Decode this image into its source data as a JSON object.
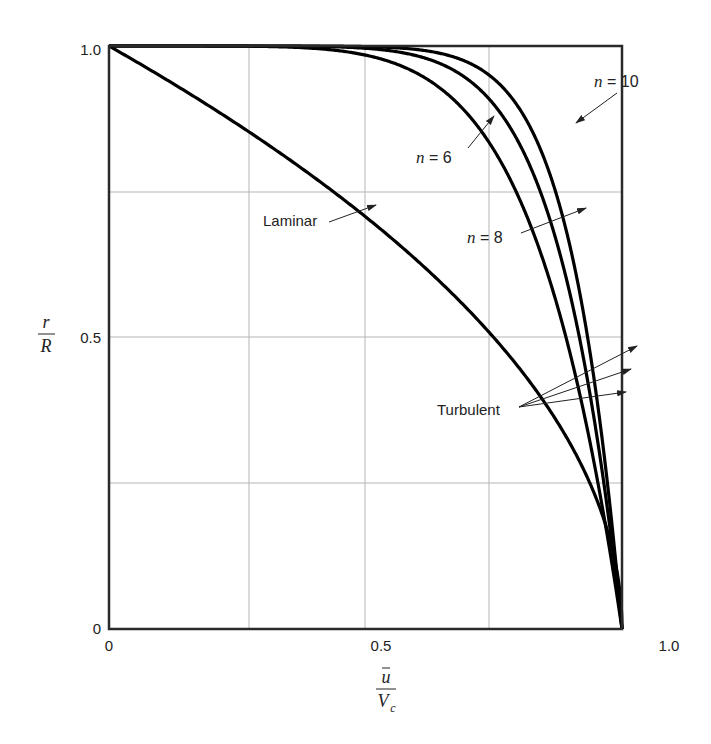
{
  "chart_data": {
    "type": "line",
    "title": "",
    "xlabel": "ū / V_c",
    "ylabel": "r / R",
    "xlim": [
      0,
      1.0
    ],
    "ylim": [
      0,
      1.0
    ],
    "grid": true,
    "x_ticks_labeled": [
      "0",
      "0.5",
      "1.0"
    ],
    "y_ticks_labeled": [
      "0",
      "0.5",
      "1.0"
    ],
    "gridlines_x": [
      0.25,
      0.5,
      0.75
    ],
    "gridlines_y": [
      0.25,
      0.5,
      0.75
    ],
    "series": [
      {
        "name": "Laminar",
        "formula": "u/Vc = 1 - (r/R)^2",
        "r": [
          0,
          0.1,
          0.2,
          0.3,
          0.4,
          0.5,
          0.6,
          0.7,
          0.8,
          0.9,
          0.95,
          1.0
        ],
        "u": [
          1.0,
          0.99,
          0.96,
          0.91,
          0.84,
          0.75,
          0.64,
          0.51,
          0.36,
          0.19,
          0.0975,
          0.0
        ]
      },
      {
        "name": "n = 6",
        "formula": "u/Vc = (1 - r/R)^(1/6)",
        "r": [
          0,
          0.1,
          0.2,
          0.3,
          0.4,
          0.5,
          0.6,
          0.7,
          0.8,
          0.9,
          0.95,
          0.99,
          1.0
        ],
        "u": [
          1.0,
          0.983,
          0.963,
          0.942,
          0.918,
          0.891,
          0.858,
          0.818,
          0.765,
          0.681,
          0.607,
          0.464,
          0.0
        ]
      },
      {
        "name": "n = 8",
        "formula": "u/Vc = (1 - r/R)^(1/8)",
        "r": [
          0,
          0.1,
          0.2,
          0.3,
          0.4,
          0.5,
          0.6,
          0.7,
          0.8,
          0.9,
          0.95,
          0.99,
          1.0
        ],
        "u": [
          1.0,
          0.987,
          0.972,
          0.956,
          0.938,
          0.917,
          0.892,
          0.86,
          0.818,
          0.75,
          0.688,
          0.562,
          0.0
        ]
      },
      {
        "name": "n = 10",
        "formula": "u/Vc = (1 - r/R)^(1/10)",
        "r": [
          0,
          0.1,
          0.2,
          0.3,
          0.4,
          0.5,
          0.6,
          0.7,
          0.8,
          0.9,
          0.95,
          0.99,
          1.0
        ],
        "u": [
          1.0,
          0.99,
          0.978,
          0.965,
          0.95,
          0.933,
          0.912,
          0.887,
          0.851,
          0.794,
          0.741,
          0.631,
          0.0
        ]
      }
    ],
    "annotations": [
      {
        "text": "Laminar",
        "points_to": "Laminar curve"
      },
      {
        "text": "n = 6",
        "points_to": "n = 6 curve"
      },
      {
        "text": "n = 8",
        "points_to": "n = 8 curve"
      },
      {
        "text": "n = 10",
        "points_to": "n = 10 curve"
      },
      {
        "text": "Turbulent",
        "points_to": "n = 6, n = 8, n = 10 curves (three arrows)"
      }
    ]
  },
  "labels": {
    "y_tick_0": "0",
    "y_tick_half": "0.5",
    "y_tick_1": "1.0",
    "x_tick_0": "0",
    "x_tick_half": "0.5",
    "x_tick_1": "1.0",
    "y_axis_num": "r",
    "y_axis_den": "R",
    "x_axis_num": "u",
    "x_axis_den": "V",
    "x_axis_den_sub": "c",
    "laminar": "Laminar",
    "turbulent": "Turbulent",
    "n_var": "n",
    "eq6": " = 6",
    "eq8": " = 8",
    "eq10": " = 10"
  }
}
